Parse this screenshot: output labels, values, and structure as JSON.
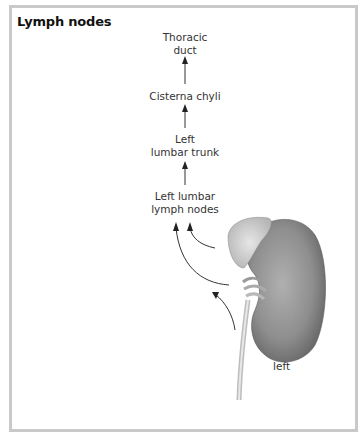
{
  "figure": {
    "title": "Lymph nodes",
    "nodes": [
      {
        "id": "thoracic-duct",
        "line1": "Thoracic",
        "line2": "duct"
      },
      {
        "id": "cisterna-chyli",
        "line1": "Cisterna chyli",
        "line2": ""
      },
      {
        "id": "left-lumbar-trunk",
        "line1": "Left",
        "line2": "lumbar trunk"
      },
      {
        "id": "left-lumbar-lymph-nodes",
        "line1": "Left lumbar",
        "line2": "lymph nodes"
      }
    ],
    "organ_label": "left",
    "colors": {
      "frame_border": "#c9c9c9",
      "arrow": "#222222",
      "kidney": "#8a8a8a",
      "adrenal": "#cfcfcf"
    }
  }
}
